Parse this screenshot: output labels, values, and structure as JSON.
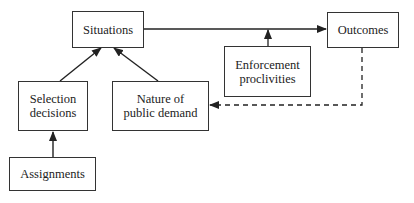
{
  "diagram": {
    "nodes": {
      "situations": {
        "label": "Situations"
      },
      "outcomes": {
        "label": "Outcomes"
      },
      "enforcement": {
        "line1": "Enforcement",
        "line2": "proclivities"
      },
      "selection": {
        "line1": "Selection",
        "line2": "decisions"
      },
      "nature": {
        "line1": "Nature of",
        "line2": "public demand"
      },
      "assignments": {
        "label": "Assignments"
      }
    },
    "edges": [
      {
        "from": "assignments",
        "to": "selection",
        "style": "solid"
      },
      {
        "from": "selection",
        "to": "situations",
        "style": "solid"
      },
      {
        "from": "nature",
        "to": "situations",
        "style": "solid"
      },
      {
        "from": "situations",
        "to": "outcomes",
        "style": "solid"
      },
      {
        "from": "enforcement",
        "to": "situations-outcomes-link",
        "style": "solid"
      },
      {
        "from": "outcomes",
        "to": "nature",
        "style": "dashed"
      }
    ]
  }
}
